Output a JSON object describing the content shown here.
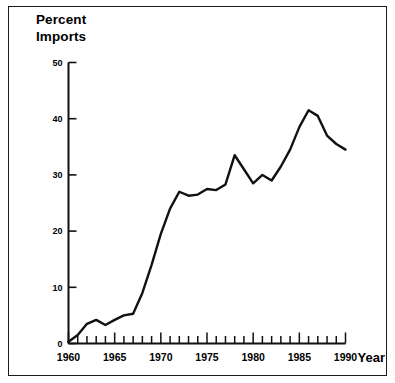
{
  "figure": {
    "title_line_1": "Percent",
    "title_line_2": "Imports",
    "x_axis_title": "Year",
    "border_color": "#1a1a1a",
    "line_color": "#111111",
    "background_color": "#ffffff"
  },
  "chart_data": {
    "type": "line",
    "title": "Percent Imports",
    "xlabel": "Year",
    "ylabel": "Percent Imports",
    "xlim": [
      1960,
      1990
    ],
    "ylim": [
      0,
      50
    ],
    "grid": false,
    "legend": "none",
    "y_ticks": [
      0,
      10,
      20,
      30,
      40,
      50
    ],
    "y_tick_labels": [
      "0",
      "10",
      "20",
      "30",
      "40",
      "50"
    ],
    "x_ticks": [
      1960,
      1961,
      1962,
      1963,
      1964,
      1965,
      1966,
      1967,
      1968,
      1969,
      1970,
      1971,
      1972,
      1973,
      1974,
      1975,
      1976,
      1977,
      1978,
      1979,
      1980,
      1981,
      1982,
      1983,
      1984,
      1985,
      1986,
      1987,
      1988,
      1989,
      1990
    ],
    "x_tick_labels": [
      "1960",
      "1965",
      "1970",
      "1975",
      "1980",
      "1985",
      "1990"
    ],
    "x_labeled_ticks": [
      1960,
      1965,
      1970,
      1975,
      1980,
      1985,
      1990
    ],
    "series": [
      {
        "name": "Percent Imports",
        "x": [
          1960,
          1961,
          1962,
          1963,
          1964,
          1965,
          1966,
          1967,
          1968,
          1969,
          1970,
          1971,
          1972,
          1973,
          1974,
          1975,
          1976,
          1977,
          1978,
          1979,
          1980,
          1981,
          1982,
          1983,
          1984,
          1985,
          1986,
          1987,
          1988,
          1989,
          1990
        ],
        "values": [
          0.3,
          1.5,
          3.5,
          4.2,
          3.3,
          4.2,
          5.0,
          5.3,
          9.0,
          14.0,
          19.5,
          24.0,
          27.0,
          26.3,
          26.5,
          27.5,
          27.3,
          28.3,
          33.5,
          31.0,
          28.5,
          30.0,
          29.0,
          31.5,
          34.5,
          38.5,
          41.5,
          40.5,
          37.0,
          35.5,
          34.5
        ]
      }
    ]
  }
}
